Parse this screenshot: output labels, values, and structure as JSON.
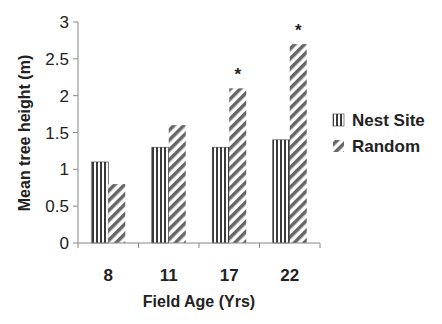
{
  "chart_data": {
    "type": "bar",
    "title": "",
    "xlabel": "Field Age (Yrs)",
    "ylabel": "Mean tree height (m)",
    "categories": [
      "8",
      "11",
      "17",
      "22"
    ],
    "series": [
      {
        "name": "Nest Site",
        "pattern": "vertical-lines",
        "values": [
          1.1,
          1.3,
          1.3,
          1.4
        ]
      },
      {
        "name": "Random",
        "pattern": "diagonal-lines",
        "values": [
          0.8,
          1.6,
          2.1,
          2.7
        ]
      }
    ],
    "yticks": [
      "0",
      "0.5",
      "1",
      "1.5",
      "2",
      "2.5",
      "3"
    ],
    "ylim": [
      0,
      3
    ],
    "grid": false,
    "legend_position": "right",
    "annotations": [
      {
        "category": "17",
        "series": "Random",
        "text": "*"
      },
      {
        "category": "22",
        "series": "Random",
        "text": "*"
      }
    ]
  },
  "colors": {
    "axis": "#888888",
    "bar_stripe": "#444444",
    "text": "#222222"
  }
}
